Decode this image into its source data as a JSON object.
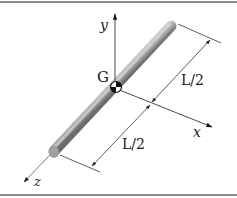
{
  "diagram": {
    "type": "slender-rod-coordinate-frame",
    "labels": {
      "center_of_mass": "G",
      "axis_x": "x",
      "axis_y": "y",
      "axis_z": "z",
      "half_length_upper": "L/2",
      "half_length_lower": "L/2"
    },
    "colors": {
      "border": "#8a8a8a",
      "rod_light": "#d0d0d0",
      "rod_dark": "#7a7a7a",
      "axis": "#2a2a2a",
      "dimension": "#2a2a2a",
      "text": "#1a1a1a"
    }
  }
}
